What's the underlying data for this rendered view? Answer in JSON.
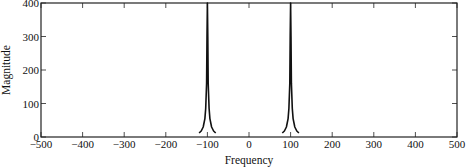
{
  "chart_data": {
    "type": "line",
    "title": "",
    "xlabel": "Frequency",
    "ylabel": "Magnitude",
    "xlim": [
      -500,
      500
    ],
    "ylim": [
      0,
      400
    ],
    "xticks": [
      -500,
      -400,
      -300,
      -200,
      -100,
      0,
      100,
      200,
      300,
      400,
      500
    ],
    "xtick_labels": [
      "−500",
      "−400",
      "−300",
      "−200",
      "−100",
      "0",
      "100",
      "200",
      "300",
      "400",
      "500"
    ],
    "yticks": [
      0,
      100,
      200,
      300,
      400
    ],
    "ytick_labels": [
      "0",
      "100",
      "200",
      "300",
      "400"
    ],
    "grid": false,
    "legend": null,
    "series": [
      {
        "name": "spectrum",
        "description": "Two sharp resonant peaks at ±100 exceeding the plot top (clipped at 400), with Lorentzian-like skirts decaying to ~0 by ±200; curve defined from about −200 to 200 with a small gap near 0.",
        "peaks": [
          {
            "x": -100,
            "y": 400
          },
          {
            "x": 100,
            "y": 400
          }
        ],
        "x_range": [
          -200,
          200
        ],
        "points": [
          [
            -200,
            1
          ],
          [
            -180,
            1.5
          ],
          [
            -160,
            2
          ],
          [
            -140,
            4
          ],
          [
            -130,
            6
          ],
          [
            -120,
            12
          ],
          [
            -115,
            18
          ],
          [
            -110,
            30
          ],
          [
            -106,
            55
          ],
          [
            -104,
            85
          ],
          [
            -102,
            160
          ],
          [
            -101,
            300
          ],
          [
            -100,
            400
          ],
          [
            -99,
            300
          ],
          [
            -98,
            160
          ],
          [
            -96,
            85
          ],
          [
            -94,
            55
          ],
          [
            -90,
            30
          ],
          [
            -85,
            18
          ],
          [
            -80,
            12
          ],
          [
            -70,
            6
          ],
          [
            -60,
            4
          ],
          [
            -40,
            2
          ],
          [
            -20,
            1.5
          ],
          [
            -2,
            1
          ],
          [
            8,
            1
          ],
          [
            20,
            1.5
          ],
          [
            40,
            2
          ],
          [
            60,
            4
          ],
          [
            70,
            6
          ],
          [
            80,
            12
          ],
          [
            85,
            18
          ],
          [
            90,
            30
          ],
          [
            94,
            55
          ],
          [
            96,
            85
          ],
          [
            98,
            160
          ],
          [
            99,
            300
          ],
          [
            100,
            400
          ],
          [
            101,
            300
          ],
          [
            102,
            160
          ],
          [
            104,
            85
          ],
          [
            106,
            55
          ],
          [
            110,
            30
          ],
          [
            115,
            18
          ],
          [
            120,
            12
          ],
          [
            130,
            6
          ],
          [
            140,
            4
          ],
          [
            160,
            2
          ],
          [
            180,
            1.5
          ],
          [
            200,
            1
          ]
        ]
      }
    ],
    "style": {
      "line_color": "#111111",
      "axis_color": "#222222",
      "background": "#ffffff"
    }
  }
}
